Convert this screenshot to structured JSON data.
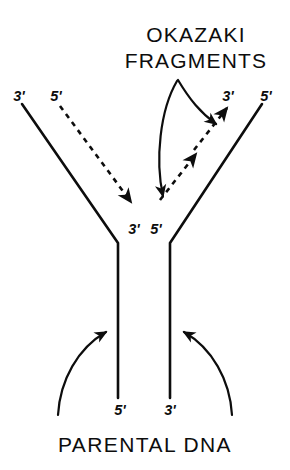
{
  "figure": {
    "kind": "dna-replication-fork-diagram",
    "title": {
      "line1": "OKAZAKI",
      "line2": "FRAGMENTS"
    },
    "caption": "PARENTAL DNA",
    "colors": {
      "ink": "#0d0d0d",
      "background": "#ffffff"
    },
    "labels": {
      "left_branch_solid": "3'",
      "left_branch_dashed": "5'",
      "right_branch_dashed": "3'",
      "right_branch_solid": "5'",
      "fork_left": "3'",
      "fork_right": "5'",
      "stem_left": "5'",
      "stem_right": "3'"
    },
    "strands": [
      {
        "name": "left-parental-template",
        "style": "solid",
        "end_label": "3'",
        "role": "template"
      },
      {
        "name": "left-leading-daughter",
        "style": "dashed",
        "end_label": "5'",
        "role": "newly-synthesized-continuous"
      },
      {
        "name": "right-okazaki-daughter",
        "style": "dashed",
        "end_label": "3'",
        "role": "newly-synthesized-discontinuous"
      },
      {
        "name": "right-parental-template",
        "style": "solid",
        "end_label": "5'",
        "role": "template"
      }
    ],
    "annotations": [
      {
        "name": "okazaki-pointer-right",
        "target": "right-okazaki-daughter"
      },
      {
        "name": "okazaki-pointer-left",
        "target": "fork-junction"
      },
      {
        "name": "parental-pointer-left",
        "target": "stem-left"
      },
      {
        "name": "parental-pointer-right",
        "target": "stem-right"
      }
    ]
  }
}
